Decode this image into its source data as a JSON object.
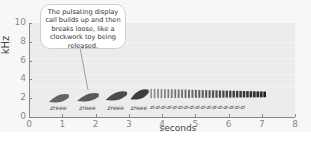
{
  "chart_data": {
    "type": "heatmap",
    "subtype": "spectrogram",
    "title": "",
    "xlabel": "seconds",
    "ylabel": "kHz",
    "xlim": [
      0,
      8
    ],
    "ylim": [
      0,
      10
    ],
    "x_ticks": [
      "0",
      "1",
      "2",
      "3",
      "4",
      "5",
      "6",
      "7",
      "8"
    ],
    "y_ticks": [
      "0",
      "2",
      "4",
      "6",
      "8",
      "10"
    ],
    "grid": false,
    "legend": null,
    "annotation": "The pulsating display call builds up and then breaks loose, like a clockwork toy being released.",
    "syllables": [
      {
        "label": "zreee",
        "start": 0.6,
        "end": 1.2,
        "freq_low": 1.6,
        "freq_high": 2.5
      },
      {
        "label": "zreee",
        "start": 1.45,
        "end": 2.1,
        "freq_low": 1.7,
        "freq_high": 2.6
      },
      {
        "label": "zreee",
        "start": 2.3,
        "end": 2.95,
        "freq_low": 1.8,
        "freq_high": 2.8
      },
      {
        "label": "zreee",
        "start": 3.05,
        "end": 3.6,
        "freq_low": 1.9,
        "freq_high": 3.0
      }
    ],
    "pulse_train": {
      "label_unit": "zi",
      "start": 3.65,
      "end": 7.15,
      "freq_low": 2.0,
      "freq_high": 3.0,
      "pulse_count": 34,
      "label_count": 17
    }
  },
  "axes": {
    "ylabel": "kHz",
    "xlabel": "seconds",
    "y_ticks": [
      "0",
      "2",
      "4",
      "6",
      "8",
      "10"
    ],
    "x_ticks": [
      "0",
      "1",
      "2",
      "3",
      "4",
      "5",
      "6",
      "7",
      "8"
    ]
  },
  "callout": {
    "text": "The pulsating display call builds up and then breaks loose, like a clockwork toy being released."
  },
  "syllable_labels": [
    "zreee",
    "zreee",
    "zreee",
    "zreee"
  ],
  "pulse_label": "zi-zi-zi-zi-zi-zi-zi-zi-zi-zi-zi-zi-zi-zi-zi-zi-zi",
  "colors": {
    "plot_bg": "#ececec",
    "page_bg": "#f7f7f7",
    "ink": "#2a2a2a",
    "axis": "#888888"
  }
}
